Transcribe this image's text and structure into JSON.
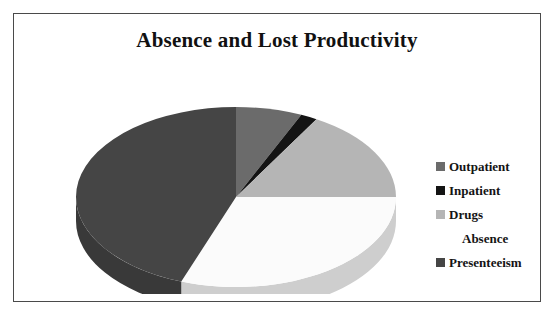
{
  "chart_data": {
    "type": "pie",
    "title": "Absence and Lost Productivity",
    "xlabel": "",
    "ylabel": "",
    "legend_position": "right",
    "grid": false,
    "three_d": true,
    "start_angle_deg": 0,
    "direction": "clockwise",
    "categories": [
      "Outpatient",
      "Inpatient",
      "Drugs",
      "Absence",
      "Presenteeism"
    ],
    "values": [
      6.7,
      1.7,
      16.6,
      30.6,
      44.4
    ],
    "slices": [
      {
        "label": "Outpatient",
        "value": 6.7,
        "percent": 6.7,
        "color": "#6b6b6b",
        "start_deg": 0,
        "end_deg": 24.1
      },
      {
        "label": "Inpatient",
        "value": 1.7,
        "percent": 1.7,
        "color": "#141414",
        "start_deg": 24.1,
        "end_deg": 30.2
      },
      {
        "label": "Drugs",
        "value": 16.6,
        "percent": 16.6,
        "color": "#b5b5b5",
        "start_deg": 30.2,
        "end_deg": 90.0
      },
      {
        "label": "Absence",
        "value": 30.6,
        "percent": 30.6,
        "color": "#fbfbfb",
        "start_deg": 90.0,
        "end_deg": 200.0
      },
      {
        "label": "Presenteeism",
        "value": 44.4,
        "percent": 44.4,
        "color": "#454545",
        "start_deg": 200.0,
        "end_deg": 360.0
      }
    ]
  },
  "chart": {
    "title": "Absence and Lost Productivity"
  },
  "legend": {
    "items": [
      {
        "label": "Outpatient",
        "color": "#6b6b6b",
        "marker": "square-marker",
        "visible_marker": true
      },
      {
        "label": "Inpatient",
        "color": "#141414",
        "marker": "square-marker",
        "visible_marker": true
      },
      {
        "label": "Drugs",
        "color": "#b5b5b5",
        "marker": "square-marker",
        "visible_marker": true
      },
      {
        "label": "Absence",
        "color": "#ffffff",
        "marker": "square-marker",
        "visible_marker": false
      },
      {
        "label": "Presenteeism",
        "color": "#454545",
        "marker": "square-marker",
        "visible_marker": true
      }
    ]
  },
  "colors": {
    "frame_border": "#4a4a4a",
    "background": "#ffffff",
    "title_text": "#111111",
    "legend_text": "#141414"
  }
}
